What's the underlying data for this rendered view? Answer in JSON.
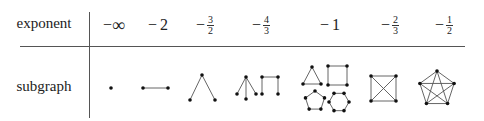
{
  "table": {
    "row_labels": {
      "exponent": "exponent",
      "subgraph": "subgraph"
    },
    "columns": [
      {
        "sign": "−",
        "value": "∞",
        "numerator": null,
        "denominator": null,
        "subgraph": "single-vertex"
      },
      {
        "sign": "−",
        "value": "2",
        "numerator": null,
        "denominator": null,
        "subgraph": "single-edge"
      },
      {
        "sign": "−",
        "value": null,
        "numerator": "3",
        "denominator": "2",
        "subgraph": "path-3-vertices"
      },
      {
        "sign": "−",
        "value": null,
        "numerator": "4",
        "denominator": "3",
        "subgraph": "star-K13-and-path-4-vertices"
      },
      {
        "sign": "−",
        "value": "1",
        "numerator": null,
        "denominator": null,
        "subgraph": "cycles-C3-C4-C5-C6"
      },
      {
        "sign": "−",
        "value": null,
        "numerator": "2",
        "denominator": "3",
        "subgraph": "complete-K4"
      },
      {
        "sign": "−",
        "value": null,
        "numerator": "1",
        "denominator": "2",
        "subgraph": "complete-K5"
      }
    ]
  }
}
